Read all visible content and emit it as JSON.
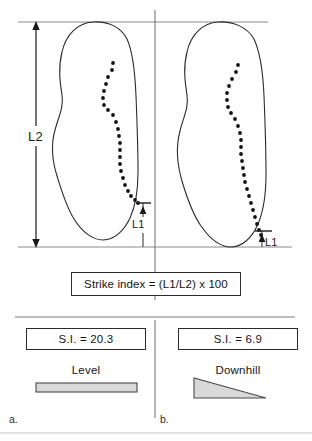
{
  "figure": {
    "caption_letters": {
      "left": "a.",
      "right": "b."
    },
    "measurements": {
      "total_length_label": "L2",
      "strike_length_label_left": "L1",
      "strike_length_label_right": "L1"
    },
    "formula": {
      "text": "Strike index  =  (L1/L2) x 100",
      "numerator": "L1",
      "denominator": "L2",
      "multiplier": "100"
    },
    "panels": [
      {
        "letter": "a.",
        "si_label": "S.I.  =  20.3",
        "si_value": 20.3,
        "condition": "Level",
        "slope_icon": "level-bar-icon"
      },
      {
        "letter": "b.",
        "si_label": "S.I.  =  6.9",
        "si_value": 6.9,
        "condition": "Downhill",
        "slope_icon": "downhill-wedge-icon"
      }
    ],
    "colors": {
      "outline": "#2b2b2b",
      "rule": "#7a7a7a",
      "dots": "#111111",
      "shape_fill": "#d9d9d9",
      "background": "#ffffff"
    }
  }
}
